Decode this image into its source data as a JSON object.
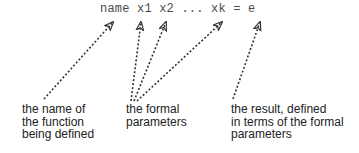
{
  "definition": {
    "text": "name x1 x2 ... xk = e"
  },
  "annotations": [
    {
      "id": "name",
      "lines": [
        "the name of",
        "the function",
        "being defined"
      ]
    },
    {
      "id": "params",
      "lines": [
        "the formal",
        "parameters"
      ]
    },
    {
      "id": "result",
      "lines": [
        "the result, defined",
        "in terms of the formal",
        "parameters"
      ]
    }
  ],
  "colors": {
    "code_text": "#4a4a4a",
    "label_text": "#222222",
    "arrow": "#333333"
  }
}
